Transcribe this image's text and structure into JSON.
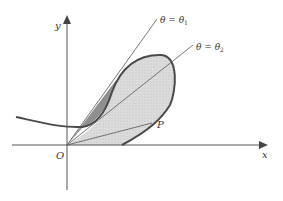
{
  "figure": {
    "axes": {
      "x_label": "x",
      "y_label": "y",
      "origin_label": "O"
    },
    "rays": [
      {
        "label_theta": "θ",
        "label_eq": " = ",
        "label_var": "θ",
        "label_sub": "1"
      },
      {
        "label_theta": "θ",
        "label_eq": " = ",
        "label_var": "θ",
        "label_sub": "2"
      }
    ],
    "point_label": "P",
    "colors": {
      "curve": "#4a4a4a",
      "loop_fill": "#d9d9d9",
      "dark_region": "#8c8c8c",
      "axis": "#555555"
    }
  }
}
